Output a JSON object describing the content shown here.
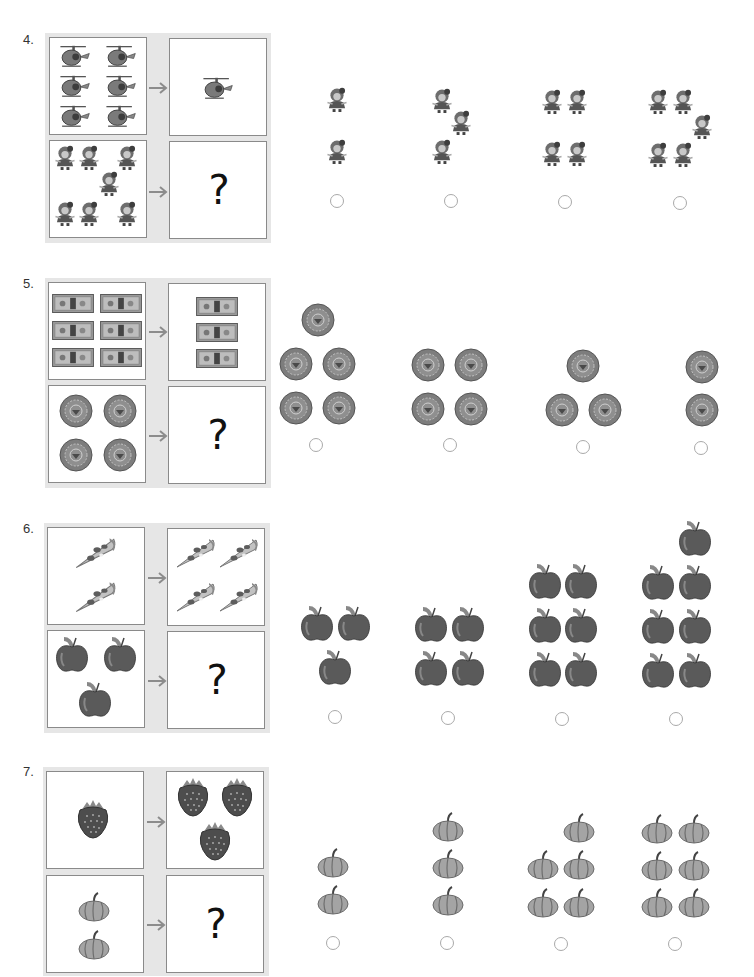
{
  "worksheet": {
    "questions": [
      {
        "number": "4.",
        "example_left": {
          "item": "helicopter",
          "count": 6
        },
        "example_right": {
          "item": "helicopter",
          "count": 1
        },
        "puzzle_left": {
          "item": "doll",
          "count": 7
        },
        "puzzle_right": {
          "label": "?"
        },
        "options": [
          {
            "item": "doll",
            "count": 2
          },
          {
            "item": "doll",
            "count": 3
          },
          {
            "item": "doll",
            "count": 4
          },
          {
            "item": "doll",
            "count": 5
          }
        ]
      },
      {
        "number": "5.",
        "example_left": {
          "item": "dollar-bill",
          "count": 6
        },
        "example_right": {
          "item": "dollar-bill",
          "count": 3
        },
        "puzzle_left": {
          "item": "coin",
          "count": 4
        },
        "puzzle_right": {
          "label": "?"
        },
        "options": [
          {
            "item": "coin",
            "count": 5
          },
          {
            "item": "coin",
            "count": 4
          },
          {
            "item": "coin",
            "count": 3
          },
          {
            "item": "coin",
            "count": 2
          }
        ]
      },
      {
        "number": "6.",
        "example_left": {
          "item": "pizza-slice",
          "count": 2
        },
        "example_right": {
          "item": "pizza-slice",
          "count": 4
        },
        "puzzle_left": {
          "item": "apple",
          "count": 3
        },
        "puzzle_right": {
          "label": "?"
        },
        "options": [
          {
            "item": "apple",
            "count": 3
          },
          {
            "item": "apple",
            "count": 4
          },
          {
            "item": "apple",
            "count": 6
          },
          {
            "item": "apple",
            "count": 7
          }
        ]
      },
      {
        "number": "7.",
        "example_left": {
          "item": "strawberry",
          "count": 1
        },
        "example_right": {
          "item": "strawberry",
          "count": 3
        },
        "puzzle_left": {
          "item": "pumpkin",
          "count": 2
        },
        "puzzle_right": {
          "label": "?"
        },
        "options": [
          {
            "item": "pumpkin",
            "count": 2
          },
          {
            "item": "pumpkin",
            "count": 3
          },
          {
            "item": "pumpkin",
            "count": 5
          },
          {
            "item": "pumpkin",
            "count": 6
          }
        ]
      }
    ],
    "colors": {
      "backdrop": "#e6e6e6",
      "panel_border": "#8a8a8a",
      "radio_border": "#a9a9a9",
      "arrow": "#8c8c8c"
    }
  }
}
